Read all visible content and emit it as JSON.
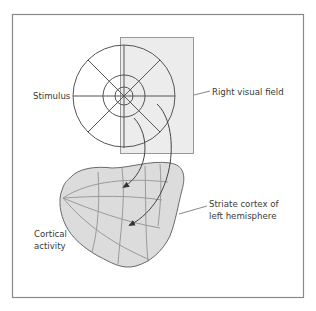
{
  "diagram": {
    "type": "retinotopic-mapping-illustration",
    "labels": {
      "stimulus": "Stimulus",
      "right_visual_field": "Right visual field",
      "striate_cortex_line1": "Striate cortex of",
      "striate_cortex_line2": "left hemisphere",
      "cortical_activity_line1": "Cortical",
      "cortical_activity_line2": "activity"
    },
    "stimulus": {
      "rings": 3,
      "spokes": 8
    },
    "colors": {
      "frame": "#8a8a8a",
      "line": "#555555",
      "visual_field_fill": "#ececec",
      "cortex_fill": "#dcdcdc",
      "cortex_grid": "#9a9a9a",
      "text": "#3a3a3a"
    }
  }
}
